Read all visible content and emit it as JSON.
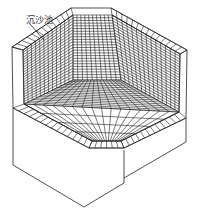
{
  "figure": {
    "label": "沉沙池",
    "stroke_color": "#222222",
    "background": "#ffffff"
  },
  "mesh": {
    "back_wall": {
      "cols": 10,
      "rows": 24
    },
    "left_wall": {
      "cols": 12,
      "rows": 22
    },
    "right_wall": {
      "cols": 14,
      "rows": 22
    },
    "floor": {
      "cols": 16,
      "rows": 16
    }
  }
}
